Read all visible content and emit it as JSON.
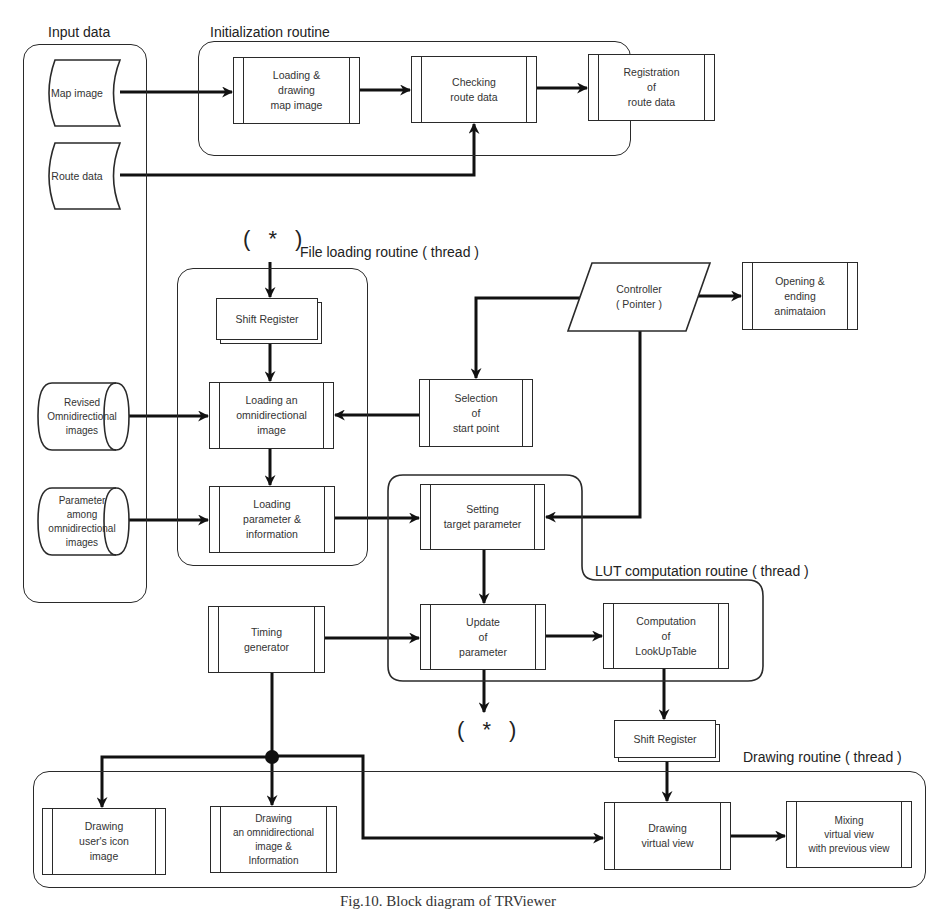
{
  "diagram": {
    "groups": {
      "input_data": "Input data",
      "initialization": "Initialization routine",
      "file_loading": "File loading routine ( thread )",
      "lut_computation": "LUT computation routine ( thread )",
      "drawing": "Drawing routine ( thread )"
    },
    "inputs": {
      "map_image": "Map image",
      "route_data": "Route data",
      "revised_omni": "Revised\nOmnidirectional\nimages",
      "parameter_omni": "Parameter\namong\nomnidirectional\nimages"
    },
    "processes": {
      "loading_drawing_map": "Loading &\ndrawing\nmap image",
      "checking_route": "Checking\nroute data",
      "registration_route": "Registration\nof\nroute data",
      "loading_omni_image": "Loading an\nomnidirectional\nimage",
      "loading_parameter": "Loading\nparameter &\ninformation",
      "selection_start": "Selection\nof\nstart point",
      "opening_ending": "Opening &\nending\nanimataion",
      "setting_target": "Setting\ntarget parameter",
      "timing_generator": "Timing\ngenerator",
      "update_parameter": "Update\nof\nparameter",
      "computation_lut": "Computation\nof\nLookUpTable",
      "drawing_user_icon": "Drawing\nuser's icon\nimage",
      "drawing_omni_info": "Drawing\nan omnidirectional\nimage &\nInformation",
      "drawing_virtual_view": "Drawing\nvirtual view",
      "mixing_virtual_view": "Mixing\nvirtual view\nwith previous view"
    },
    "io": {
      "controller": "Controller\n( Pointer )"
    },
    "registers": {
      "shift_register_top": "Shift Register",
      "shift_register_bottom": "Shift Register"
    },
    "connectors": {
      "loop_top": "( * )",
      "loop_bottom": "( * )"
    },
    "caption": "Fig.10. Block diagram of TRViewer"
  }
}
